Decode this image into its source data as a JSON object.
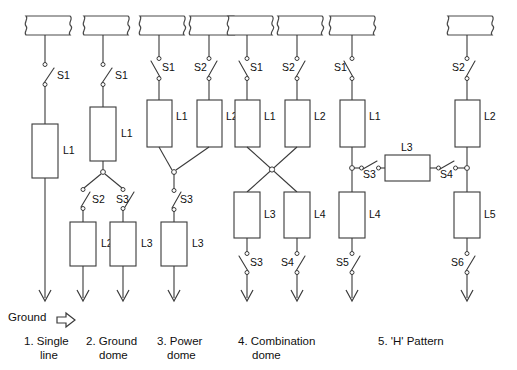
{
  "figure": {
    "ground_label": "Ground",
    "ground_arrow_icon": "right-arrow-outline-icon",
    "line_color": "#3a3a3a",
    "background_color": "#ffffff"
  },
  "captions": [
    {
      "id": "cap1",
      "line1": "1. Single",
      "line2": "line"
    },
    {
      "id": "cap2",
      "line1": "2. Ground",
      "line2": "dome"
    },
    {
      "id": "cap3",
      "line1": "3. Power",
      "line2": "dome"
    },
    {
      "id": "cap4",
      "line1": "4. Combination",
      "line2": "dome"
    },
    {
      "id": "cap5",
      "line1": "5. 'H' Pattern",
      "line2": ""
    }
  ],
  "schemes": [
    {
      "name": "single-line",
      "loads": [
        {
          "label": "L1"
        }
      ],
      "switches": [
        {
          "label": "S1"
        }
      ],
      "buses": 1,
      "grounds": 1
    },
    {
      "name": "ground-dome",
      "loads": [
        {
          "label": "L1"
        },
        {
          "label": "L2"
        },
        {
          "label": "L3"
        }
      ],
      "switches": [
        {
          "label": "S1"
        },
        {
          "label": "S2"
        },
        {
          "label": "S3"
        }
      ],
      "buses": 1,
      "grounds": 2
    },
    {
      "name": "power-dome",
      "loads": [
        {
          "label": "L1"
        },
        {
          "label": "L2"
        },
        {
          "label": "L3"
        }
      ],
      "switches": [
        {
          "label": "S1"
        },
        {
          "label": "S2"
        },
        {
          "label": "S3"
        }
      ],
      "buses": 2,
      "grounds": 1
    },
    {
      "name": "combination-dome",
      "loads": [
        {
          "label": "L1"
        },
        {
          "label": "L2"
        },
        {
          "label": "L3"
        },
        {
          "label": "L4"
        }
      ],
      "switches": [
        {
          "label": "S1"
        },
        {
          "label": "S2"
        },
        {
          "label": "S3"
        },
        {
          "label": "S4"
        }
      ],
      "buses": 2,
      "grounds": 2
    },
    {
      "name": "h-pattern",
      "loads": [
        {
          "label": "L1"
        },
        {
          "label": "L2"
        },
        {
          "label": "L3"
        },
        {
          "label": "L4"
        },
        {
          "label": "L5"
        }
      ],
      "switches": [
        {
          "label": "S1"
        },
        {
          "label": "S2"
        },
        {
          "label": "S3"
        },
        {
          "label": "S4"
        },
        {
          "label": "S5"
        },
        {
          "label": "S6"
        }
      ],
      "buses": 2,
      "grounds": 2
    }
  ],
  "labels": {
    "s1": "S1",
    "s2": "S2",
    "s3": "S3",
    "s4": "S4",
    "s5": "S5",
    "s6": "S6",
    "l1": "L1",
    "l2": "L2",
    "l3": "L3",
    "l4": "L4",
    "l5": "L5"
  }
}
